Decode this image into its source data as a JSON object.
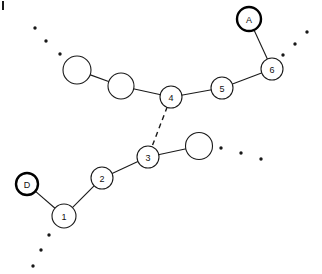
{
  "figure": {
    "background_color": "#ffffff",
    "stroke_color": "#1a1a1a",
    "node_fill_color": "#ffffff",
    "label_color": "#111111",
    "width": 322,
    "height": 274
  },
  "nodes": [
    {
      "id": "A",
      "label": "A",
      "cx": 249,
      "cy": 19,
      "r": 12,
      "emphasis": "thick"
    },
    {
      "id": "n6",
      "label": "6",
      "cx": 272,
      "cy": 69,
      "r": 11,
      "emphasis": "normal"
    },
    {
      "id": "n5",
      "label": "5",
      "cx": 222,
      "cy": 88,
      "r": 11,
      "emphasis": "normal"
    },
    {
      "id": "n4",
      "label": "4",
      "cx": 171,
      "cy": 97,
      "r": 11,
      "emphasis": "normal"
    },
    {
      "id": "u1",
      "label": "",
      "cx": 121,
      "cy": 86,
      "r": 13,
      "emphasis": "normal"
    },
    {
      "id": "u2",
      "label": "",
      "cx": 77,
      "cy": 70,
      "r": 14,
      "emphasis": "normal"
    },
    {
      "id": "n3",
      "label": "3",
      "cx": 148,
      "cy": 157,
      "r": 11,
      "emphasis": "normal"
    },
    {
      "id": "u3",
      "label": "",
      "cx": 199,
      "cy": 146,
      "r": 13.5,
      "emphasis": "normal"
    },
    {
      "id": "n2",
      "label": "2",
      "cx": 102,
      "cy": 178,
      "r": 11,
      "emphasis": "normal"
    },
    {
      "id": "n1",
      "label": "1",
      "cx": 64,
      "cy": 216,
      "r": 12,
      "emphasis": "normal"
    },
    {
      "id": "D",
      "label": "D",
      "cx": 27,
      "cy": 184,
      "r": 11,
      "emphasis": "thick"
    }
  ],
  "edges": [
    {
      "from": "A",
      "to": "n6",
      "style": "solid"
    },
    {
      "from": "n6",
      "to": "n5",
      "style": "solid"
    },
    {
      "from": "n5",
      "to": "n4",
      "style": "solid"
    },
    {
      "from": "n4",
      "to": "u1",
      "style": "solid"
    },
    {
      "from": "u1",
      "to": "u2",
      "style": "solid"
    },
    {
      "from": "n4",
      "to": "n3",
      "style": "dashed"
    },
    {
      "from": "n3",
      "to": "u3",
      "style": "solid"
    },
    {
      "from": "n3",
      "to": "n2",
      "style": "solid"
    },
    {
      "from": "n2",
      "to": "n1",
      "style": "solid"
    },
    {
      "from": "n1",
      "to": "D",
      "style": "solid"
    }
  ],
  "specks": [
    {
      "cx": 35,
      "cy": 28,
      "r": 1.7
    },
    {
      "cx": 46,
      "cy": 41,
      "r": 1.7
    },
    {
      "cx": 60,
      "cy": 54,
      "r": 1.7
    },
    {
      "cx": 307,
      "cy": 32,
      "r": 1.7
    },
    {
      "cx": 295,
      "cy": 44,
      "r": 1.7
    },
    {
      "cx": 283,
      "cy": 55,
      "r": 1.7
    },
    {
      "cx": 221,
      "cy": 148,
      "r": 1.7
    },
    {
      "cx": 241,
      "cy": 153,
      "r": 1.7
    },
    {
      "cx": 261,
      "cy": 159,
      "r": 1.7
    },
    {
      "cx": 49,
      "cy": 235,
      "r": 1.7
    },
    {
      "cx": 41,
      "cy": 250,
      "r": 1.7
    },
    {
      "cx": 33,
      "cy": 266,
      "r": 1.7
    }
  ],
  "corner_tick": {
    "x": 2,
    "y": 1,
    "width": 2,
    "height": 9
  }
}
